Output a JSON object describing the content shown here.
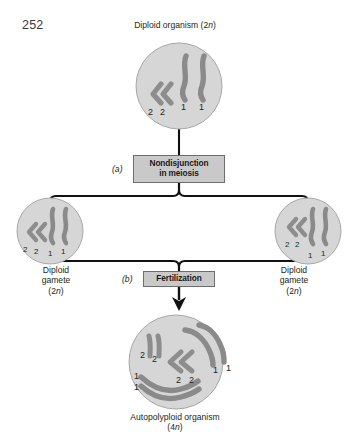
{
  "page": {
    "number": "252",
    "background": "#ffffff"
  },
  "figure": {
    "title_top": "Diploid organism (2n)",
    "cells": {
      "parent": {
        "name": "diploid-organism",
        "caption": "Diploid organism (2n)",
        "ploidy": "2n",
        "chromosomes": [
          {
            "label": "2",
            "type": "short-bent"
          },
          {
            "label": "2",
            "type": "short-bent"
          },
          {
            "label": "1",
            "type": "long-wavy"
          },
          {
            "label": "1",
            "type": "long-wavy"
          }
        ]
      },
      "gamete_left": {
        "name": "diploid-gamete-left",
        "caption_line1": "Diploid",
        "caption_line2": "gamete",
        "caption_line3": "(2n)",
        "ploidy": "2n",
        "chromosomes": [
          {
            "label": "2",
            "type": "short-bent"
          },
          {
            "label": "2",
            "type": "short-bent"
          },
          {
            "label": "1",
            "type": "long-wavy"
          },
          {
            "label": "1",
            "type": "long-wavy"
          }
        ]
      },
      "gamete_right": {
        "name": "diploid-gamete-right",
        "caption_line1": "Diploid",
        "caption_line2": "gamete",
        "caption_line3": "(2n)",
        "ploidy": "2n",
        "chromosomes": [
          {
            "label": "2",
            "type": "short-bent"
          },
          {
            "label": "2",
            "type": "short-bent"
          },
          {
            "label": "1",
            "type": "long-wavy"
          },
          {
            "label": "1",
            "type": "long-wavy"
          }
        ]
      },
      "zygote": {
        "name": "autopolyploid-organism",
        "caption_line1": "Autopolyploid organism",
        "caption_line2": "(4n)",
        "ploidy": "4n",
        "chromosomes": [
          {
            "label": "2",
            "type": "short-bent"
          },
          {
            "label": "2",
            "type": "short-bent"
          },
          {
            "label": "2",
            "type": "short-bent"
          },
          {
            "label": "2",
            "type": "short-bent"
          },
          {
            "label": "1",
            "type": "long-wavy"
          },
          {
            "label": "1",
            "type": "long-wavy"
          },
          {
            "label": "1",
            "type": "long-wavy"
          },
          {
            "label": "1",
            "type": "long-wavy"
          }
        ]
      }
    },
    "processes": [
      {
        "key": "a",
        "marker": "(a)",
        "line1": "Nondisjunction",
        "line2": "in meiosis"
      },
      {
        "key": "b",
        "marker": "(b)",
        "line1": "Fertilization",
        "line2": ""
      }
    ],
    "chromosome_marks": {
      "parent": [
        "2",
        "2",
        "1",
        "1"
      ],
      "gamete_left": [
        "2",
        "2",
        "1",
        "1"
      ],
      "gamete_right": [
        "2",
        "2",
        "1",
        "1"
      ],
      "zygote": [
        "2",
        "2",
        "2",
        "2",
        "1",
        "1",
        "1",
        "1"
      ]
    },
    "colors": {
      "cell_fill": "#d6d6d6",
      "cell_stroke": "#9a9a9a",
      "chromosome": "#8d8d8d",
      "chromosome_dark": "#7e7e7e",
      "box_fill": "#c9c9c9",
      "box_stroke": "#6d6d6d",
      "connector": "#1a1a1a",
      "text": "#231f20"
    }
  }
}
